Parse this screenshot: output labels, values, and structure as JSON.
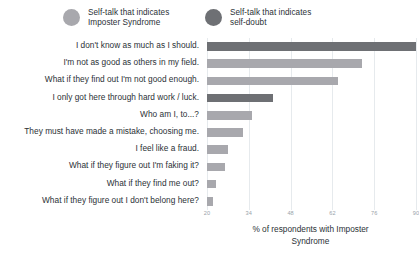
{
  "legend": {
    "items": [
      {
        "label": "Self-talk that indicates\nImposter Syndrome",
        "color": "#a8a8ad",
        "key": "imposter"
      },
      {
        "label": "Self-talk that indicates\nself-doubt",
        "color": "#6e7074",
        "key": "selfdoubt"
      }
    ]
  },
  "axis": {
    "title": "% of respondents with Imposter\nSyndrome",
    "ticks": [
      "20",
      "34",
      "48",
      "62",
      "76",
      "90"
    ]
  },
  "colors": {
    "imposter_bar": "#a8a8ad",
    "selfdoubt_bar": "#6e7074",
    "gridline": "#e6eaed",
    "text": "#2b3136",
    "tick_text": "#9aa3aa",
    "background": "#ffffff"
  },
  "chart_data": {
    "type": "bar",
    "orientation": "horizontal",
    "title": "",
    "xlabel": "% of respondents with Imposter Syndrome",
    "ylabel": "",
    "xlim": [
      20,
      90
    ],
    "xticks": [
      20,
      34,
      48,
      62,
      76,
      90
    ],
    "grid": true,
    "legend_position": "top",
    "categories": [
      "I don't know as much as I should.",
      "I'm not as good as others in my field.",
      "What if they find out I'm not good enough.",
      "I only got here through hard work / luck.",
      "Who am I, to...?",
      "They must have made a mistake, choosing me.",
      "I feel like a fraud.",
      "What if they figure out I'm faking it?",
      "What if they find me out?",
      "What if they figure out I don't belong here?"
    ],
    "values": [
      90,
      72,
      64,
      42,
      35,
      32,
      27,
      26,
      23,
      22
    ],
    "series_of_point": [
      "selfdoubt",
      "imposter",
      "imposter",
      "selfdoubt",
      "imposter",
      "imposter",
      "imposter",
      "imposter",
      "imposter",
      "imposter"
    ]
  }
}
